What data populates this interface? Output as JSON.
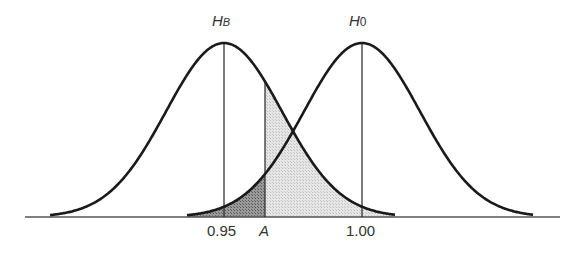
{
  "diagram": {
    "type": "hypothesis-test-normal-curves",
    "curves": [
      {
        "id": "HB",
        "label_main": "H",
        "label_sub": "B",
        "mean_label": "0.95"
      },
      {
        "id": "H0",
        "label_main": "H",
        "label_sub": "0",
        "mean_label": "1.00"
      }
    ],
    "critical_value_label": "A",
    "axis_labels": [
      "0.95",
      "A",
      "1.00"
    ],
    "shading": {
      "dark": "area under H0 curve left of A (alpha)",
      "light": "area under HB curve right of A (beta)"
    },
    "colors": {
      "line": "#1a1a1a",
      "dark_fill": "#8c8c8c",
      "light_fill": "#dcdcdc"
    }
  }
}
